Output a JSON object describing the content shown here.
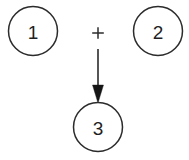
{
  "diagram": {
    "type": "flow-diagram",
    "background_color": "#ffffff",
    "stroke_color": "#2b2b2b",
    "text_color": "#1f1f1f",
    "arrowhead_color": "#161616",
    "nodes": [
      {
        "id": "node-1",
        "label": "1",
        "cx": 33,
        "cy": 31,
        "r": 24.5,
        "role": "operand"
      },
      {
        "id": "node-2",
        "label": "2",
        "cx": 158,
        "cy": 31,
        "r": 24.5,
        "role": "operand"
      },
      {
        "id": "node-3",
        "label": "3",
        "cx": 98,
        "cy": 127,
        "r": 24.5,
        "role": "result"
      }
    ],
    "operator": {
      "id": "operator-plus",
      "label": "+",
      "cx": 98,
      "cy": 33
    },
    "arrow": {
      "id": "arrow-down",
      "x": 98,
      "y_start": 49,
      "y_shaft_end": 86,
      "y_tip": 103,
      "head_half_width": 5.5
    }
  }
}
